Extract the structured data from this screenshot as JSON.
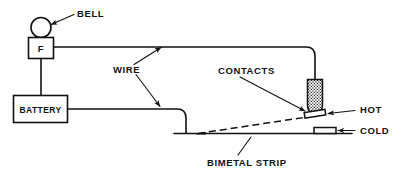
{
  "diagram": {
    "background_color": "#ffffff",
    "line_color": "#111111",
    "labels": {
      "bell": "BELL",
      "wire": "WIRE",
      "contacts": "CONTACTS",
      "hot": "HOT",
      "cold": "COLD",
      "bimetal_strip": "BIMETAL STRIP",
      "fuse_box": "F",
      "battery": "BATTERY"
    },
    "components": [
      {
        "name": "bell",
        "shape": "circle",
        "label": "BELL"
      },
      {
        "name": "fuse-box",
        "shape": "square",
        "label": "F"
      },
      {
        "name": "battery",
        "shape": "rectangle",
        "label": "BATTERY"
      },
      {
        "name": "contact-probe",
        "shape": "stippled-cylinder",
        "label": "CONTACTS"
      },
      {
        "name": "hot-contact",
        "shape": "small-rectangle",
        "label": "HOT"
      },
      {
        "name": "cold-contact",
        "shape": "small-rectangle",
        "label": "COLD"
      },
      {
        "name": "bimetal-strip",
        "shape": "horizontal-line",
        "label": "BIMETAL STRIP"
      },
      {
        "name": "deflected-strip",
        "shape": "dashed-line",
        "label": ""
      }
    ]
  }
}
